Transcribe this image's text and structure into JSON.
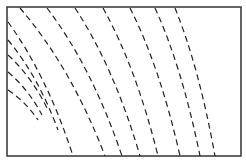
{
  "figure": {
    "type": "rectangle-with-dashed-lines",
    "frame": {
      "x": 7,
      "y": 7,
      "width": 234,
      "height": 149,
      "stroke": "#333333",
      "stroke_width": 1.5
    },
    "line_color": "#222222",
    "dash_pattern": "6 4",
    "lines": [
      {
        "start": [
          8,
          22
        ],
        "end": [
          73,
          156
        ]
      },
      {
        "start": [
          8,
          40
        ],
        "end": [
          58,
          130
        ]
      },
      {
        "start": [
          8,
          55
        ],
        "end": [
          48,
          110
        ]
      },
      {
        "start": [
          8,
          72
        ],
        "end": [
          42,
          115
        ]
      },
      {
        "start": [
          8,
          90
        ],
        "end": [
          38,
          120
        ]
      },
      {
        "start": [
          20,
          8
        ],
        "end": [
          105,
          156
        ]
      },
      {
        "start": [
          47,
          8
        ],
        "end": [
          122,
          156
        ]
      },
      {
        "start": [
          75,
          8
        ],
        "end": [
          140,
          156
        ]
      },
      {
        "start": [
          103,
          8
        ],
        "end": [
          158,
          156
        ]
      },
      {
        "start": [
          130,
          8
        ],
        "end": [
          180,
          156
        ]
      },
      {
        "start": [
          155,
          8
        ],
        "end": [
          200,
          156
        ]
      },
      {
        "start": [
          175,
          8
        ],
        "end": [
          215,
          156
        ]
      }
    ]
  },
  "caption": ""
}
